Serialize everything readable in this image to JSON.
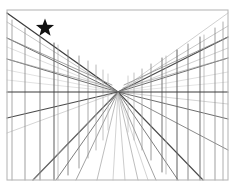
{
  "artwork": {
    "title": "One-Point Perspective Corridor Study",
    "medium": "pencil line drawing",
    "canvas": {
      "width": 236,
      "height": 193,
      "background_color": "#ffffff"
    },
    "frame": {
      "name": "drawing-border",
      "x": 7,
      "y": 10,
      "width": 221,
      "height": 170,
      "stroke_color": "#b8b8b8",
      "stroke_width": 1.1
    },
    "vanishing_point": {
      "x": 118,
      "y": 92,
      "label": "VP"
    },
    "horizon_line": {
      "name": "horizon-line",
      "y": 92,
      "x_start": 7,
      "x_end": 228,
      "stroke_color": "#3a3a3a",
      "stroke_width": 1.2
    },
    "ink_colors": {
      "dark": "#3d3d3d",
      "medium": "#6e6e6e",
      "light": "#a0a0a0",
      "faint": "#c2c2c2",
      "star": "#111111"
    },
    "star_marker": {
      "name": "star-marker",
      "cx": 45,
      "cy": 28,
      "outer_radius": 9.5,
      "inner_radius": 4.0,
      "points": 5,
      "fill": "#111111"
    },
    "left_wall": {
      "name": "left-wall",
      "orthogonal_rays": [
        {
          "edge_x": 7,
          "edge_y": 13,
          "weight": 1.25,
          "color": "#3d3d3d"
        },
        {
          "edge_x": 7,
          "edge_y": 22,
          "weight": 0.6,
          "color": "#a0a0a0"
        },
        {
          "edge_x": 7,
          "edge_y": 38,
          "weight": 1.0,
          "color": "#6e6e6e"
        },
        {
          "edge_x": 7,
          "edge_y": 47,
          "weight": 0.55,
          "color": "#c2c2c2"
        },
        {
          "edge_x": 7,
          "edge_y": 59,
          "weight": 1.0,
          "color": "#6e6e6e"
        },
        {
          "edge_x": 7,
          "edge_y": 70,
          "weight": 0.5,
          "color": "#c2c2c2"
        },
        {
          "edge_x": 7,
          "edge_y": 80,
          "weight": 0.5,
          "color": "#c2c2c2"
        },
        {
          "edge_x": 7,
          "edge_y": 118,
          "weight": 1.1,
          "color": "#4a4a4a"
        },
        {
          "edge_x": 7,
          "edge_y": 133,
          "weight": 0.55,
          "color": "#b0b0b0"
        },
        {
          "edge_x": 33,
          "edge_y": 180,
          "weight": 1.1,
          "color": "#4a4a4a"
        },
        {
          "edge_x": 56,
          "edge_y": 180,
          "weight": 0.9,
          "color": "#6e6e6e"
        },
        {
          "edge_x": 76,
          "edge_y": 180,
          "weight": 0.8,
          "color": "#8a8a8a"
        },
        {
          "edge_x": 97,
          "edge_y": 180,
          "weight": 0.7,
          "color": "#a0a0a0"
        }
      ],
      "vertical_posts": [
        {
          "x": 12,
          "top_y": 20,
          "bottom_y": 180,
          "weight": 0.85,
          "color": "#9a9a9a"
        },
        {
          "x": 25,
          "top_y": 28,
          "bottom_y": 180,
          "weight": 0.85,
          "color": "#8f8f8f"
        },
        {
          "x": 40,
          "top_y": 36,
          "bottom_y": 180,
          "weight": 0.9,
          "color": "#7d7d7d"
        },
        {
          "x": 54,
          "top_y": 43,
          "bottom_y": 180,
          "weight": 1.0,
          "color": "#5f5f5f"
        },
        {
          "x": 58,
          "top_y": 45,
          "bottom_y": 180,
          "weight": 0.7,
          "color": "#a8a8a8"
        },
        {
          "x": 68,
          "top_y": 50,
          "bottom_y": 175,
          "weight": 0.9,
          "color": "#7a7a7a"
        },
        {
          "x": 79,
          "top_y": 56,
          "bottom_y": 168,
          "weight": 0.85,
          "color": "#8a8a8a"
        },
        {
          "x": 88,
          "top_y": 61,
          "bottom_y": 158,
          "weight": 0.8,
          "color": "#969696"
        },
        {
          "x": 96,
          "top_y": 65,
          "bottom_y": 150,
          "weight": 0.75,
          "color": "#a0a0a0"
        },
        {
          "x": 103,
          "top_y": 70,
          "bottom_y": 140,
          "weight": 0.7,
          "color": "#ababab"
        },
        {
          "x": 108,
          "top_y": 74,
          "bottom_y": 130,
          "weight": 0.65,
          "color": "#b6b6b6"
        }
      ]
    },
    "right_wall": {
      "name": "right-wall",
      "orthogonal_rays": [
        {
          "edge_x": 228,
          "edge_y": 13,
          "weight": 0.6,
          "color": "#b0b0b0"
        },
        {
          "edge_x": 228,
          "edge_y": 26,
          "weight": 0.65,
          "color": "#a8a8a8"
        },
        {
          "edge_x": 228,
          "edge_y": 37,
          "weight": 1.15,
          "color": "#4a4a4a"
        },
        {
          "edge_x": 228,
          "edge_y": 48,
          "weight": 0.6,
          "color": "#b0b0b0"
        },
        {
          "edge_x": 228,
          "edge_y": 58,
          "weight": 1.0,
          "color": "#6e6e6e"
        },
        {
          "edge_x": 228,
          "edge_y": 72,
          "weight": 0.55,
          "color": "#c2c2c2"
        },
        {
          "edge_x": 228,
          "edge_y": 82,
          "weight": 0.5,
          "color": "#c9c9c9"
        },
        {
          "edge_x": 228,
          "edge_y": 104,
          "weight": 0.6,
          "color": "#b6b6b6"
        },
        {
          "edge_x": 228,
          "edge_y": 119,
          "weight": 1.0,
          "color": "#6e6e6e"
        },
        {
          "edge_x": 228,
          "edge_y": 150,
          "weight": 0.9,
          "color": "#7d7d7d"
        },
        {
          "edge_x": 203,
          "edge_y": 180,
          "weight": 1.1,
          "color": "#4a4a4a"
        },
        {
          "edge_x": 178,
          "edge_y": 180,
          "weight": 0.9,
          "color": "#6e6e6e"
        },
        {
          "edge_x": 156,
          "edge_y": 180,
          "weight": 0.8,
          "color": "#8a8a8a"
        },
        {
          "edge_x": 138,
          "edge_y": 180,
          "weight": 0.7,
          "color": "#a0a0a0"
        },
        {
          "edge_x": 125,
          "edge_y": 180,
          "weight": 0.65,
          "color": "#b0b0b0"
        }
      ],
      "vertical_posts": [
        {
          "x": 128,
          "top_y": 76,
          "bottom_y": 132,
          "weight": 0.65,
          "color": "#b6b6b6"
        },
        {
          "x": 134,
          "top_y": 73,
          "bottom_y": 140,
          "weight": 0.7,
          "color": "#ababab"
        },
        {
          "x": 142,
          "top_y": 69,
          "bottom_y": 150,
          "weight": 0.8,
          "color": "#9a9a9a"
        },
        {
          "x": 151,
          "top_y": 64,
          "bottom_y": 160,
          "weight": 0.85,
          "color": "#8a8a8a"
        },
        {
          "x": 162,
          "top_y": 58,
          "bottom_y": 172,
          "weight": 0.95,
          "color": "#6e6e6e"
        },
        {
          "x": 166,
          "top_y": 56,
          "bottom_y": 174,
          "weight": 0.7,
          "color": "#a8a8a8"
        },
        {
          "x": 177,
          "top_y": 50,
          "bottom_y": 180,
          "weight": 1.0,
          "color": "#5f5f5f"
        },
        {
          "x": 188,
          "top_y": 44,
          "bottom_y": 180,
          "weight": 0.9,
          "color": "#7d7d7d"
        },
        {
          "x": 200,
          "top_y": 37,
          "bottom_y": 180,
          "weight": 0.95,
          "color": "#6b6b6b"
        },
        {
          "x": 204,
          "top_y": 35,
          "bottom_y": 180,
          "weight": 0.7,
          "color": "#a8a8a8"
        },
        {
          "x": 215,
          "top_y": 28,
          "bottom_y": 180,
          "weight": 0.85,
          "color": "#8f8f8f"
        },
        {
          "x": 223,
          "top_y": 22,
          "bottom_y": 180,
          "weight": 0.8,
          "color": "#9a9a9a"
        }
      ]
    },
    "floor_converging_lines": {
      "name": "floor-converging-lines",
      "rays": [
        {
          "edge_x": 33,
          "edge_y": 180,
          "weight": 0.8,
          "color": "#8a8a8a"
        },
        {
          "edge_x": 113,
          "edge_y": 180,
          "weight": 0.6,
          "color": "#b6b6b6"
        },
        {
          "edge_x": 148,
          "edge_y": 180,
          "weight": 0.6,
          "color": "#b6b6b6"
        }
      ]
    },
    "cross_members": {
      "name": "cross-members",
      "left": [
        {
          "x1": 7,
          "y1": 38,
          "x2": 112,
          "y2": 85,
          "weight": 0.8,
          "color": "#8a8a8a"
        },
        {
          "x1": 7,
          "y1": 59,
          "x2": 113,
          "y2": 88,
          "weight": 0.7,
          "color": "#a0a0a0"
        }
      ],
      "right": [
        {
          "x1": 228,
          "y1": 37,
          "x2": 124,
          "y2": 85,
          "weight": 0.8,
          "color": "#8a8a8a"
        },
        {
          "x1": 228,
          "y1": 58,
          "x2": 123,
          "y2": 88,
          "weight": 0.7,
          "color": "#a0a0a0"
        }
      ]
    }
  }
}
